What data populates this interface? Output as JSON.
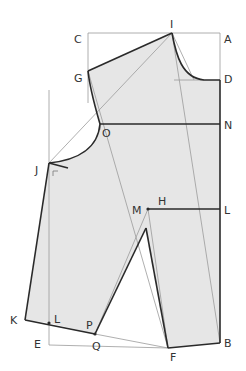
{
  "diagram": {
    "type": "sewing-pattern-bodice-draft",
    "colors": {
      "fill": "#e6e6e6",
      "outline": "#2a2a2a",
      "guide": "#9a9a9a",
      "label": "#333333",
      "background": "#ffffff"
    },
    "labels": {
      "I": "I",
      "A": "A",
      "C": "C",
      "G": "G",
      "D": "D",
      "O": "O",
      "N": "N",
      "J": "J",
      "M": "M",
      "H": "H",
      "L_right": "L",
      "K": "K",
      "L_left": "L",
      "P": "P",
      "E": "E",
      "Q": "Q",
      "F": "F",
      "B": "B"
    }
  }
}
